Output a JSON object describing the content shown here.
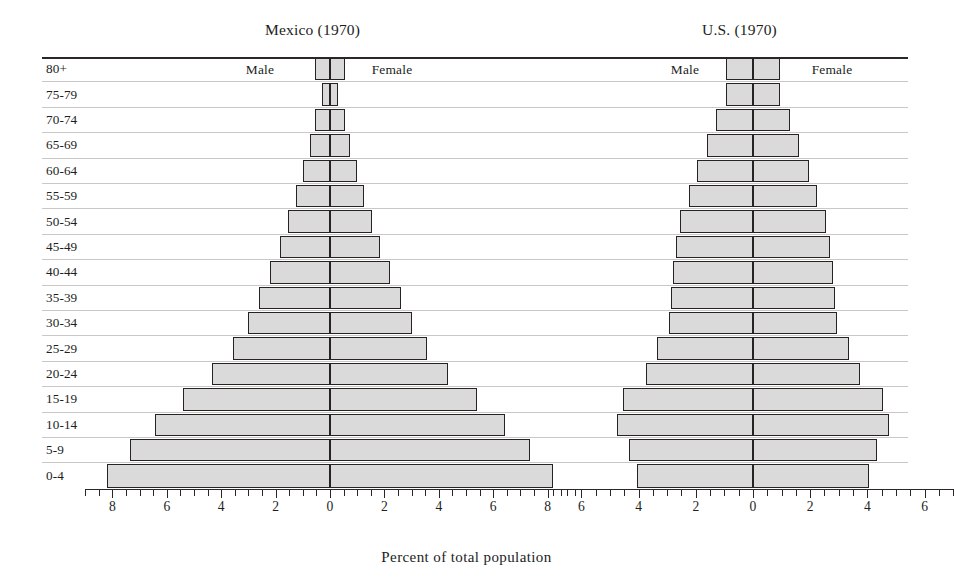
{
  "figure": {
    "xlabel": "Percent of total population",
    "bar_fill": "#dadada",
    "bar_stroke": "#262321",
    "gridline_color": "#c9c8c6"
  },
  "panels": [
    {
      "key": "mexico",
      "title": "Mexico (1970)",
      "male_label": "Male",
      "female_label": "Female"
    },
    {
      "key": "us",
      "title": "U.S. (1970)",
      "male_label": "Male",
      "female_label": "Female"
    }
  ],
  "chart_data": {
    "type": "bar",
    "subtype": "population-pyramid",
    "title": "",
    "xlabel": "Percent of total population",
    "ylabel": "",
    "grid": true,
    "legend_position": "inside-top",
    "categories": [
      "80+",
      "75-79",
      "70-74",
      "65-69",
      "60-64",
      "55-59",
      "50-54",
      "45-49",
      "40-44",
      "35-39",
      "30-34",
      "25-29",
      "20-24",
      "15-19",
      "10-14",
      "5-9",
      "0-4"
    ],
    "panels": [
      {
        "name": "Mexico (1970)",
        "xlim": [
          -9.0,
          9.0
        ],
        "xticks": [
          -8,
          -6,
          -4,
          -2,
          0,
          2,
          4,
          6,
          8
        ],
        "xticklabels": [
          "8",
          "6",
          "4",
          "2",
          "0",
          "2",
          "4",
          "6",
          "8"
        ],
        "series": [
          {
            "name": "Male",
            "side": "left",
            "values": [
              0.55,
              0.3,
              0.55,
              0.75,
              1.0,
              1.25,
              1.55,
              1.85,
              2.2,
              2.6,
              3.0,
              3.55,
              4.35,
              5.4,
              6.45,
              7.35,
              8.2
            ]
          },
          {
            "name": "Female",
            "side": "right",
            "values": [
              0.55,
              0.3,
              0.55,
              0.75,
              1.0,
              1.25,
              1.55,
              1.85,
              2.2,
              2.6,
              3.0,
              3.55,
              4.35,
              5.4,
              6.45,
              7.35,
              8.2
            ]
          }
        ]
      },
      {
        "name": "U.S. (1970)",
        "xlim": [
          -7.0,
          7.0
        ],
        "xticks": [
          -6,
          -4,
          -2,
          0,
          2,
          4,
          6
        ],
        "xticklabels": [
          "6",
          "4",
          "2",
          "0",
          "2",
          "4",
          "6"
        ],
        "series": [
          {
            "name": "Male",
            "side": "left",
            "values": [
              0.95,
              0.95,
              1.3,
              1.6,
              1.95,
              2.25,
              2.55,
              2.7,
              2.8,
              2.85,
              2.95,
              3.35,
              3.75,
              4.55,
              4.75,
              4.35,
              4.05
            ]
          },
          {
            "name": "Female",
            "side": "right",
            "values": [
              0.95,
              0.95,
              1.3,
              1.6,
              1.95,
              2.25,
              2.55,
              2.7,
              2.8,
              2.85,
              2.95,
              3.35,
              3.75,
              4.55,
              4.75,
              4.35,
              4.05
            ]
          }
        ]
      }
    ]
  }
}
